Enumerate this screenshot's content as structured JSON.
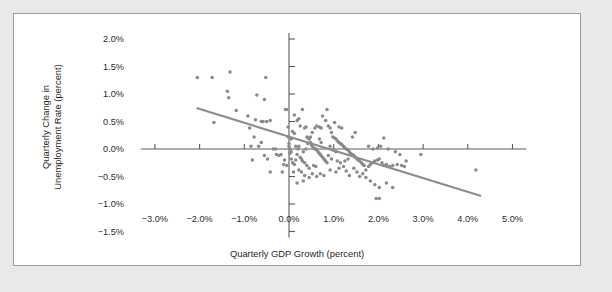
{
  "figure": {
    "background_color": "#ffffff",
    "page_background_color": "#e9e9e9",
    "border_color": "#9a9a9a"
  },
  "chart_data": {
    "type": "scatter",
    "title": "",
    "xlabel": "Quarterly GDP Growth (percent)",
    "ylabel_line1": "Quarterly Change in",
    "ylabel_line2": "Unemployment Rate (percent)",
    "xlim": [
      -3.5,
      5.5
    ],
    "ylim": [
      -1.5,
      2.0
    ],
    "grid": false,
    "legend": "none",
    "marker_color": "#8a8a8a",
    "trendline_color": "#8c8c8c",
    "axis_color": "#5a5a5a",
    "xticks": [
      -3.0,
      -2.0,
      -1.0,
      0.0,
      1.0,
      2.0,
      3.0,
      4.0,
      5.0
    ],
    "xticklabels": [
      "−3.0%",
      "−2.0%",
      "−1.0%",
      "0.0%",
      "1.0%",
      "2.0%",
      "3.0%",
      "4.0%",
      "5.0%"
    ],
    "yticks": [
      -1.5,
      -1.0,
      -0.5,
      0.0,
      0.5,
      1.0,
      1.5,
      2.0
    ],
    "yticklabels": [
      "−1.5%",
      "−1.0%",
      "−0.5%",
      "0.0%",
      "0.5%",
      "1.0%",
      "1.5%",
      "2.0%"
    ],
    "trendline": {
      "x0": -2.05,
      "y0": 0.74,
      "x1": 4.28,
      "y1": -0.85
    },
    "points": [
      [
        -2.05,
        1.3
      ],
      [
        -1.72,
        1.3
      ],
      [
        -1.32,
        1.4
      ],
      [
        -0.52,
        1.3
      ],
      [
        -1.38,
        1.05
      ],
      [
        -1.35,
        0.93
      ],
      [
        -0.72,
        0.98
      ],
      [
        -0.55,
        0.9
      ],
      [
        -1.18,
        0.7
      ],
      [
        -0.92,
        0.6
      ],
      [
        -0.75,
        0.53
      ],
      [
        -0.62,
        0.5
      ],
      [
        -0.58,
        0.5
      ],
      [
        -0.5,
        0.5
      ],
      [
        -0.42,
        0.52
      ],
      [
        -1.68,
        0.48
      ],
      [
        -0.88,
        0.38
      ],
      [
        -0.78,
        0.22
      ],
      [
        -0.85,
        0.05
      ],
      [
        -0.82,
        -0.2
      ],
      [
        -0.35,
        0.0
      ],
      [
        -0.3,
        0.0
      ],
      [
        -0.28,
        -0.1
      ],
      [
        -0.22,
        -0.12
      ],
      [
        -0.18,
        -0.1
      ],
      [
        -0.15,
        -0.42
      ],
      [
        -0.12,
        -0.28
      ],
      [
        -0.1,
        -0.2
      ],
      [
        -0.08,
        0.72
      ],
      [
        -0.05,
        0.72
      ],
      [
        -0.02,
        0.4
      ],
      [
        -0.02,
        0.22
      ],
      [
        0.0,
        0.1
      ],
      [
        0.0,
        0.05
      ],
      [
        0.02,
        0.0
      ],
      [
        0.02,
        -0.08
      ],
      [
        0.05,
        -0.05
      ],
      [
        0.05,
        -0.18
      ],
      [
        0.08,
        -0.25
      ],
      [
        0.1,
        -0.42
      ],
      [
        0.12,
        -0.28
      ],
      [
        0.15,
        -0.2
      ],
      [
        0.18,
        -0.1
      ],
      [
        0.2,
        0.0
      ],
      [
        0.22,
        0.05
      ],
      [
        0.18,
        0.52
      ],
      [
        0.22,
        0.55
      ],
      [
        0.12,
        0.62
      ],
      [
        0.3,
        0.72
      ],
      [
        0.35,
        0.38
      ],
      [
        0.38,
        0.4
      ],
      [
        0.4,
        0.22
      ],
      [
        0.42,
        0.2
      ],
      [
        0.45,
        0.18
      ],
      [
        0.48,
        0.12
      ],
      [
        0.5,
        0.08
      ],
      [
        0.52,
        0.05
      ],
      [
        0.55,
        0.02
      ],
      [
        0.58,
        0.0
      ],
      [
        0.6,
        0.0
      ],
      [
        0.62,
        -0.02
      ],
      [
        0.65,
        -0.05
      ],
      [
        0.68,
        -0.08
      ],
      [
        0.7,
        -0.1
      ],
      [
        0.72,
        -0.12
      ],
      [
        0.75,
        -0.15
      ],
      [
        0.78,
        -0.18
      ],
      [
        0.8,
        -0.2
      ],
      [
        0.82,
        -0.22
      ],
      [
        0.85,
        -0.25
      ],
      [
        0.55,
        -0.3
      ],
      [
        0.6,
        -0.32
      ],
      [
        0.45,
        -0.35
      ],
      [
        0.4,
        -0.3
      ],
      [
        0.35,
        -0.25
      ],
      [
        0.3,
        -0.22
      ],
      [
        0.28,
        -0.18
      ],
      [
        0.25,
        -0.15
      ],
      [
        0.32,
        -0.05
      ],
      [
        0.38,
        0.0
      ],
      [
        0.42,
        0.1
      ],
      [
        0.48,
        0.22
      ],
      [
        0.52,
        0.3
      ],
      [
        0.58,
        0.38
      ],
      [
        0.62,
        0.42
      ],
      [
        0.68,
        0.4
      ],
      [
        0.72,
        0.38
      ],
      [
        0.88,
        0.42
      ],
      [
        0.92,
        0.38
      ],
      [
        0.95,
        0.3
      ],
      [
        0.98,
        0.22
      ],
      [
        1.02,
        0.2
      ],
      [
        1.05,
        0.18
      ],
      [
        1.08,
        0.15
      ],
      [
        1.12,
        0.12
      ],
      [
        1.15,
        0.1
      ],
      [
        1.18,
        0.08
      ],
      [
        1.22,
        0.05
      ],
      [
        1.25,
        0.02
      ],
      [
        1.28,
        0.0
      ],
      [
        1.32,
        -0.02
      ],
      [
        1.35,
        -0.05
      ],
      [
        1.38,
        -0.08
      ],
      [
        1.42,
        -0.1
      ],
      [
        1.45,
        -0.12
      ],
      [
        1.48,
        -0.15
      ],
      [
        1.52,
        -0.18
      ],
      [
        1.55,
        -0.2
      ],
      [
        1.58,
        -0.22
      ],
      [
        1.62,
        -0.25
      ],
      [
        1.65,
        -0.28
      ],
      [
        1.68,
        -0.3
      ],
      [
        0.92,
        -0.38
      ],
      [
        1.05,
        -0.42
      ],
      [
        1.12,
        -0.35
      ],
      [
        1.22,
        -0.32
      ],
      [
        1.28,
        -0.4
      ],
      [
        1.35,
        -0.48
      ],
      [
        0.78,
        -0.48
      ],
      [
        0.7,
        -0.45
      ],
      [
        0.62,
        -0.5
      ],
      [
        0.52,
        -0.45
      ],
      [
        0.45,
        -0.52
      ],
      [
        0.35,
        -0.48
      ],
      [
        0.28,
        -0.42
      ],
      [
        0.22,
        -0.38
      ],
      [
        1.45,
        -0.35
      ],
      [
        1.52,
        -0.42
      ],
      [
        1.58,
        -0.5
      ],
      [
        1.65,
        -0.45
      ],
      [
        1.72,
        -0.38
      ],
      [
        1.78,
        -0.32
      ],
      [
        1.82,
        -0.28
      ],
      [
        1.88,
        -0.25
      ],
      [
        1.92,
        -0.22
      ],
      [
        1.98,
        -0.2
      ],
      [
        2.02,
        -0.18
      ],
      [
        2.08,
        -0.25
      ],
      [
        2.12,
        -0.3
      ],
      [
        2.18,
        -0.28
      ],
      [
        2.25,
        -0.32
      ],
      [
        2.32,
        -0.3
      ],
      [
        2.42,
        -0.28
      ],
      [
        2.52,
        -0.3
      ],
      [
        2.58,
        -0.32
      ],
      [
        2.12,
        0.2
      ],
      [
        2.05,
        0.05
      ],
      [
        1.98,
        0.02
      ],
      [
        1.88,
        0.0
      ],
      [
        2.22,
        0.0
      ],
      [
        2.38,
        -0.05
      ],
      [
        2.48,
        -0.1
      ],
      [
        1.72,
        -0.52
      ],
      [
        1.82,
        -0.58
      ],
      [
        1.92,
        -0.65
      ],
      [
        2.02,
        -0.7
      ],
      [
        1.95,
        -0.9
      ],
      [
        2.02,
        -0.9
      ],
      [
        2.18,
        -0.62
      ],
      [
        2.32,
        -0.7
      ],
      [
        2.95,
        -0.1
      ],
      [
        4.18,
        -0.38
      ],
      [
        0.85,
        0.72
      ],
      [
        0.75,
        0.6
      ],
      [
        0.82,
        0.52
      ],
      [
        1.02,
        0.48
      ],
      [
        1.12,
        0.4
      ],
      [
        1.18,
        0.38
      ],
      [
        0.18,
        -0.62
      ],
      [
        0.32,
        -0.58
      ],
      [
        -0.42,
        -0.42
      ],
      [
        -0.48,
        -0.18
      ],
      [
        -0.55,
        -0.12
      ],
      [
        1.78,
        0.05
      ],
      [
        2.62,
        -0.22
      ],
      [
        1.42,
        0.22
      ],
      [
        1.48,
        0.3
      ],
      [
        0.92,
        0.05
      ],
      [
        0.98,
        -0.02
      ],
      [
        1.05,
        -0.05
      ],
      [
        0.68,
        0.18
      ],
      [
        0.72,
        0.12
      ],
      [
        0.88,
        -0.12
      ],
      [
        0.95,
        -0.18
      ],
      [
        1.08,
        -0.22
      ],
      [
        1.15,
        -0.25
      ],
      [
        1.25,
        -0.22
      ],
      [
        1.32,
        -0.18
      ],
      [
        -0.62,
        0.12
      ],
      [
        -0.68,
        0.05
      ],
      [
        0.08,
        0.32
      ],
      [
        0.12,
        0.28
      ],
      [
        0.25,
        0.42
      ],
      [
        0.15,
        0.05
      ],
      [
        0.05,
        0.18
      ],
      [
        -0.05,
        -0.3
      ]
    ]
  }
}
